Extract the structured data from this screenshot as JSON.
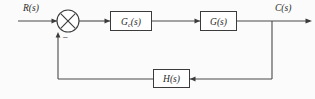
{
  "diagram": {
    "background_color": "#fbfbfb",
    "line_color": "#4a4a4a",
    "stroke_color": "#3b3b3b",
    "signals": {
      "input": "R(s)",
      "output": "C(s)",
      "feedback_sign": "−"
    },
    "summing_junction": {
      "name": "summing-junction",
      "glyph": "cross-circle"
    },
    "blocks": [
      {
        "id": "controller",
        "base": "G",
        "subscript": "c",
        "argument": "(s)",
        "full_label": "Gc(s)"
      },
      {
        "id": "plant",
        "base": "G",
        "subscript": "",
        "argument": "(s)",
        "full_label": "G(s)"
      },
      {
        "id": "feedback",
        "base": "H",
        "subscript": "",
        "argument": "(s)",
        "full_label": "H(s)"
      }
    ]
  }
}
